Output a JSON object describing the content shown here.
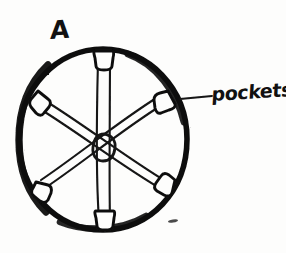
{
  "page": {
    "background_color": "#fdfdfc",
    "ink_color": "#111111",
    "width": 286,
    "height": 253,
    "style": "hand-drawn pencil-and-ink sketch"
  },
  "figure": {
    "panel_label": "A",
    "outer_circle": {
      "center_x": 103,
      "center_y": 140,
      "radius_x": 84,
      "radius_y": 91,
      "stroke_width": 6
    },
    "hub": {
      "label": "center-hub-ring",
      "center_x": 104,
      "center_y": 147,
      "radius_x": 9,
      "radius_y": 12,
      "stroke_width": 2.6
    },
    "pockets": [
      {
        "name": "pocket-top",
        "angle_deg": 272,
        "x": 103,
        "y": 52
      },
      {
        "name": "pocket-upper-right",
        "angle_deg": 330,
        "x": 163,
        "y": 101
      },
      {
        "name": "pocket-lower-right",
        "angle_deg": 30,
        "x": 167,
        "y": 186
      },
      {
        "name": "pocket-bottom",
        "angle_deg": 90,
        "x": 105,
        "y": 225
      },
      {
        "name": "pocket-lower-left",
        "angle_deg": 150,
        "x": 44,
        "y": 192
      },
      {
        "name": "pocket-upper-left",
        "angle_deg": 210,
        "x": 39,
        "y": 101
      }
    ],
    "spokes": [
      {
        "name": "spoke-vertical",
        "from": "pocket-top",
        "to": "pocket-bottom"
      },
      {
        "name": "spoke-diagonal-1",
        "from": "pocket-upper-left",
        "to": "pocket-lower-right"
      },
      {
        "name": "spoke-diagonal-2",
        "from": "pocket-upper-right",
        "to": "pocket-lower-left"
      }
    ],
    "stray_mark": {
      "name": "stray-pencil-mark",
      "x": 173,
      "y": 221
    }
  },
  "annotations": {
    "panel_label_text": "A",
    "callout": {
      "text": "pockets",
      "leader_line": {
        "x1": 180,
        "y1": 99,
        "x2": 211,
        "y2": 96
      },
      "points_to": "pocket-upper-right"
    }
  }
}
